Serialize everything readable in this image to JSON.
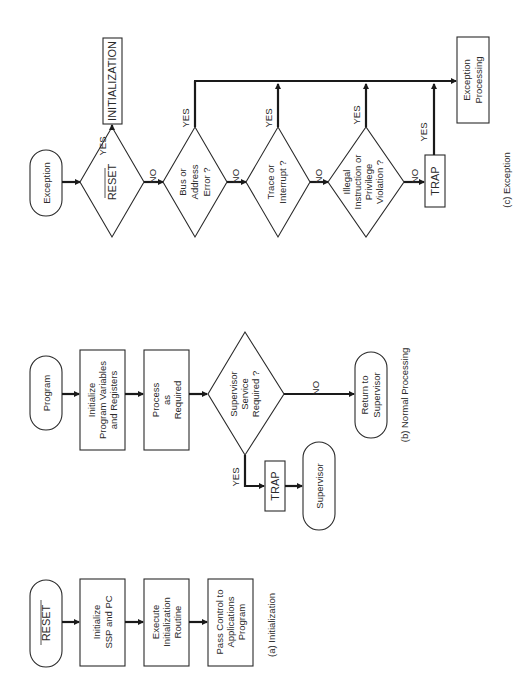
{
  "diagram": {
    "orientation": "rotated 90deg counter-clockwise",
    "initialization": {
      "caption": "(a)  Initialization",
      "start": "RESET",
      "step1": [
        "Initialize",
        "SSP and PC"
      ],
      "step2": [
        "Execute",
        "Initialization",
        "Routine"
      ],
      "step3": [
        "Pass Control to",
        "Applications",
        "Program"
      ]
    },
    "normal_processing": {
      "caption": "(b)  Normal Processing",
      "start": "Program",
      "step1": [
        "Initialize",
        "Program Variables",
        "and Registers"
      ],
      "step2": [
        "Process",
        "as",
        "Required"
      ],
      "decision": [
        "Supervisor",
        "Service",
        "Required ?"
      ],
      "yes_label": "YES",
      "no_label": "NO",
      "trap": "TRAP",
      "supervisor": "Supervisor",
      "return": [
        "Return to",
        "Supervisor"
      ]
    },
    "exception": {
      "caption": "(c)  Exception",
      "start": "Exception",
      "reset_decision": "RESET",
      "initialization_box": "INITIALIZATION",
      "bus_decision": [
        "Bus or",
        "Address",
        "Error ?"
      ],
      "trace_decision": [
        "Trace or",
        "Interrupt ?"
      ],
      "illegal_decision": [
        "Illegal",
        "Instruction or",
        "Privilege",
        "Violation ?"
      ],
      "trap": "TRAP",
      "processing": [
        "Exception",
        "Processing"
      ],
      "yes_label": "YES",
      "no_label": "NO"
    }
  }
}
